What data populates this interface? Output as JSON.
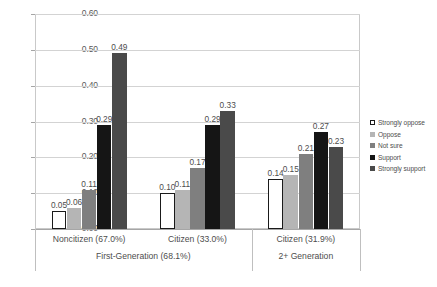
{
  "chart_data": {
    "type": "bar",
    "title": "",
    "subtitle": "",
    "xlabel": "",
    "ylabel": "",
    "ylim": [
      0.0,
      0.6
    ],
    "yticks": [
      "0.00",
      "0.10",
      "0.20",
      "0.30",
      "0.40",
      "0.50",
      "0.60"
    ],
    "ytick_values": [
      0.0,
      0.1,
      0.2,
      0.3,
      0.4,
      0.5,
      0.6
    ],
    "grid": true,
    "legend_position": "right",
    "categories": [
      "Noncitizen (67.0%)",
      "Citizen (33.0%)",
      "Citizen (31.9%)"
    ],
    "group_headers": [
      "First-Generation (68.1%)",
      "2+ Generation"
    ],
    "group_header_spans": [
      2,
      1
    ],
    "series": [
      {
        "name": "Strongly oppose",
        "color": "#ffffff",
        "border": "#1a1a1a",
        "values": [
          0.05,
          0.1,
          0.14
        ],
        "labels": [
          "0.05",
          "0.10",
          "0.14"
        ]
      },
      {
        "name": "Oppose",
        "color": "#b5b5b5",
        "border": "#b5b5b5",
        "values": [
          0.06,
          0.11,
          0.15
        ],
        "labels": [
          "0.06",
          "0.11",
          "0.15"
        ]
      },
      {
        "name": "Not sure",
        "color": "#7f7f7f",
        "border": "#7f7f7f",
        "values": [
          0.11,
          0.17,
          0.21
        ],
        "labels": [
          "0.11",
          "0.17",
          "0.21"
        ]
      },
      {
        "name": "Support",
        "color": "#151515",
        "border": "#151515",
        "values": [
          0.29,
          0.29,
          0.27
        ],
        "labels": [
          "0.29",
          "0.29",
          "0.27"
        ]
      },
      {
        "name": "Strongly support",
        "color": "#4a4a4a",
        "border": "#4a4a4a",
        "values": [
          0.49,
          0.33,
          0.23
        ],
        "labels": [
          "0.49",
          "0.33",
          "0.23"
        ]
      }
    ]
  }
}
